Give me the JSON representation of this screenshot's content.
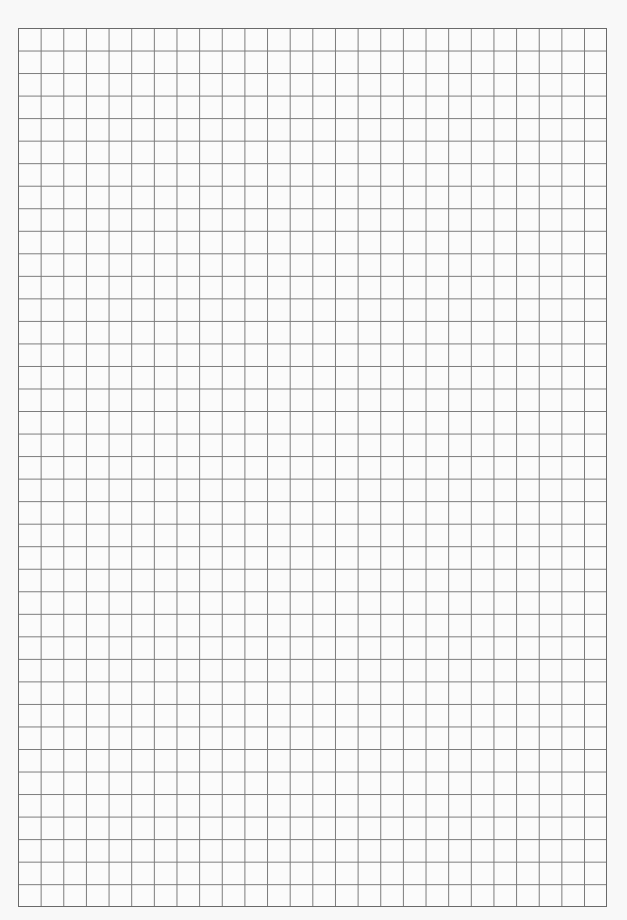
{
  "sheet": {
    "type": "graph-paper",
    "columns": 26,
    "rows": 39,
    "line_color": "#7a7a7a",
    "border_color": "#6a6a6a",
    "background_color": "#f8f8f8"
  }
}
